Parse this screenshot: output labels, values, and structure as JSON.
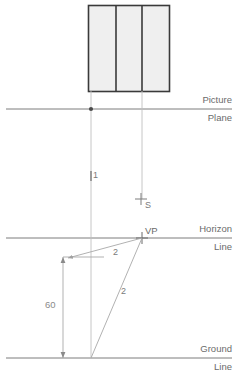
{
  "diagram": {
    "colors": {
      "line": "#8c8c8c",
      "reference_line": "#7d7d7d",
      "object_stroke": "#3a3a3a",
      "object_fill": "#efefef",
      "text": "#6e6e6e",
      "background": "#ffffff"
    },
    "object": {
      "name": "elevation-rectangle",
      "panels": 3
    },
    "reference_lines": [
      {
        "id": "picture-plane",
        "label_top": "Picture",
        "label_bottom": "Plane",
        "y": 109
      },
      {
        "id": "horizon-line",
        "label_top": "Horizon",
        "label_bottom": "Line",
        "y": 238
      },
      {
        "id": "ground-line",
        "label_top": "Ground",
        "label_bottom": "Line",
        "y": 358
      }
    ],
    "points": [
      {
        "id": "station-point",
        "label": "S",
        "x": 141,
        "y": 199
      },
      {
        "id": "vanishing-point",
        "label": "VP",
        "x": 142,
        "y": 238
      },
      {
        "id": "picture-plane-point",
        "label": "",
        "x": 91,
        "y": 109
      }
    ],
    "annotations": [
      {
        "id": "annotation-1",
        "label": "1",
        "x": 94,
        "y": 176
      },
      {
        "id": "annotation-2a",
        "label": "2",
        "x": 117,
        "y": 254
      },
      {
        "id": "annotation-2b",
        "label": "2",
        "x": 124,
        "y": 293
      }
    ],
    "dimension": {
      "id": "height-dimension",
      "label": "60",
      "value": 60,
      "x": 63,
      "y_top": 257,
      "y_bottom": 358
    }
  }
}
